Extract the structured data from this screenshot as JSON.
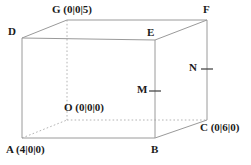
{
  "figure": {
    "kind": "3d-cuboid-coordinate-diagram",
    "canvas": {
      "width": 251,
      "height": 165
    },
    "colors": {
      "background": "#ffffff",
      "solid_edge": "#9a9a9a",
      "hidden_edge": "#b4b4b4",
      "label_text": "#1a1a1a",
      "tick_mark": "#4a4a4a"
    },
    "labels": {
      "G": "G (0|0|5)",
      "F": "F",
      "D": "D",
      "E": "E",
      "N": "N",
      "M": "M",
      "O": "O (0|0|0)",
      "C": "C (0|6|0)",
      "A": "A (4|0|0)",
      "B": "B"
    },
    "vertices": {
      "A": {
        "name": "A",
        "coords": "(4|0|0)",
        "x": 22,
        "y": 138
      },
      "B": {
        "name": "B",
        "coords": "",
        "x": 155,
        "y": 138
      },
      "C": {
        "name": "C",
        "coords": "(0|6|0)",
        "x": 207,
        "y": 120
      },
      "O": {
        "name": "O",
        "coords": "(0|0|0)",
        "x": 67,
        "y": 120
      },
      "D": {
        "name": "D",
        "coords": "",
        "x": 22,
        "y": 38
      },
      "E": {
        "name": "E",
        "coords": "",
        "x": 155,
        "y": 40
      },
      "F": {
        "name": "F",
        "coords": "",
        "x": 207,
        "y": 20
      },
      "G": {
        "name": "G",
        "coords": "(0|0|5)",
        "x": 67,
        "y": 20
      }
    },
    "points": {
      "M": {
        "name": "M",
        "x": 155,
        "y": 90
      },
      "N": {
        "name": "N",
        "x": 207,
        "y": 68
      }
    }
  }
}
